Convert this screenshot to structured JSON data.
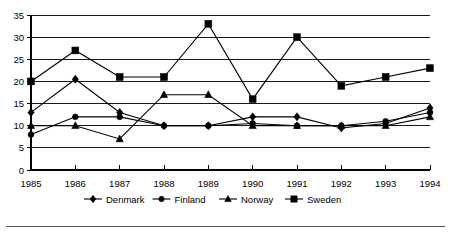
{
  "chart_data": {
    "type": "line",
    "title": "",
    "subtitle": "",
    "xlabel": "",
    "ylabel": "",
    "x": [
      1985,
      1986,
      1987,
      1988,
      1989,
      1990,
      1991,
      1992,
      1993,
      1994
    ],
    "categories": [
      "1985",
      "1986",
      "1987",
      "1988",
      "1989",
      "1990",
      "1991",
      "1992",
      "1993",
      "1994"
    ],
    "ylim": [
      0,
      35
    ],
    "yticks": [
      0,
      5,
      10,
      15,
      20,
      25,
      30,
      35
    ],
    "ytick_labels": [
      "0",
      "5",
      "10",
      "15",
      "20",
      "25",
      "30",
      "35"
    ],
    "grid": "horizontal",
    "legend_position": "bottom",
    "series": [
      {
        "name": "Denmark",
        "marker": "diamond",
        "color": "#000000",
        "values": [
          13,
          20.5,
          13,
          10,
          10,
          12,
          12,
          9.5,
          10.5,
          14
        ]
      },
      {
        "name": "Finland",
        "marker": "circle",
        "color": "#000000",
        "values": [
          8,
          12,
          12,
          10,
          10,
          10.5,
          10,
          10,
          11,
          13
        ]
      },
      {
        "name": "Norway",
        "marker": "triangle",
        "color": "#000000",
        "values": [
          10,
          10,
          7,
          17,
          17,
          10,
          10,
          10,
          10,
          12
        ]
      },
      {
        "name": "Sweden",
        "marker": "square",
        "color": "#000000",
        "values": [
          20,
          27,
          21,
          21,
          33,
          16,
          30,
          19,
          21,
          23
        ]
      }
    ]
  },
  "legend": {
    "entries": [
      {
        "label": "Denmark",
        "marker": "diamond"
      },
      {
        "label": "Finland",
        "marker": "circle"
      },
      {
        "label": "Norway",
        "marker": "triangle"
      },
      {
        "label": "Sweden",
        "marker": "square"
      }
    ]
  }
}
